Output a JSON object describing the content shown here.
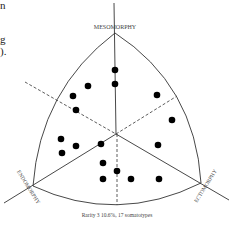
{
  "text_fragments": [
    {
      "text": "n",
      "y": 0
    },
    {
      "text": "g",
      "y": 34
    },
    {
      "text": ").",
      "y": 46
    }
  ],
  "chart_data": {
    "type": "scatter",
    "caption": "Rarity 3 10.6%, 17 somatotypes",
    "axis_labels": {
      "top": "MESOMORPHY",
      "left": "ENDOMORPHY",
      "right": "ECTOMORPHY"
    },
    "grid": false,
    "geometry": {
      "apex": [
        115,
        33
      ],
      "left_corner": [
        33,
        186
      ],
      "right_corner": [
        201,
        183
      ],
      "center": [
        116,
        134
      ],
      "bottom_mid": [
        117,
        205
      ]
    },
    "points": [
      {
        "x": 115,
        "y": 70
      },
      {
        "x": 115,
        "y": 84
      },
      {
        "x": 88,
        "y": 86
      },
      {
        "x": 73,
        "y": 96
      },
      {
        "x": 76,
        "y": 110
      },
      {
        "x": 157,
        "y": 95
      },
      {
        "x": 172,
        "y": 120
      },
      {
        "x": 158,
        "y": 145
      },
      {
        "x": 61,
        "y": 139
      },
      {
        "x": 62,
        "y": 153
      },
      {
        "x": 76,
        "y": 146
      },
      {
        "x": 101,
        "y": 144
      },
      {
        "x": 103,
        "y": 163
      },
      {
        "x": 117,
        "y": 171
      },
      {
        "x": 103,
        "y": 179
      },
      {
        "x": 131,
        "y": 179
      },
      {
        "x": 159,
        "y": 179
      }
    ],
    "point_count": 17
  }
}
